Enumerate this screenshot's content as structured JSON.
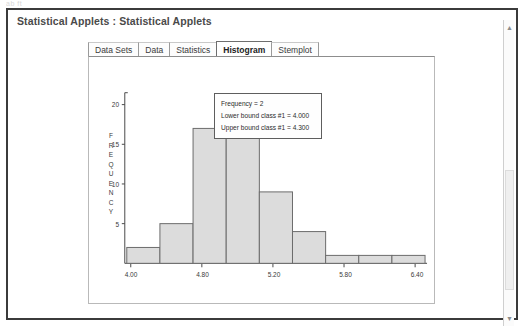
{
  "chrome_ghost": "ab ft",
  "window": {
    "title": "Statistical Applets : Statistical Applets"
  },
  "tabs": [
    {
      "label": "Data Sets",
      "selected": false
    },
    {
      "label": "Data",
      "selected": false
    },
    {
      "label": "Statistics",
      "selected": false
    },
    {
      "label": "Histogram",
      "selected": true
    },
    {
      "label": "Stemplot",
      "selected": false
    }
  ],
  "tooltip": {
    "frequency": "Frequency = 2",
    "lower_bound": "Lower bound class #1 = 4.000",
    "upper_bound": "Upper bound class #1 = 4.300"
  },
  "scrollbar": {
    "up_arrow": "▲",
    "down_arrow": "▼"
  },
  "chart_data": {
    "type": "bar",
    "title": "",
    "xlabel": "",
    "ylabel": "FREQUENCY",
    "ylabel_letters": [
      "F",
      "R",
      "E",
      "Q",
      "U",
      "E",
      "N",
      "C",
      "Y"
    ],
    "categories": [
      "4.00",
      "4.30",
      "4.60",
      "4.90",
      "5.20",
      "5.50",
      "5.80",
      "6.10",
      "6.40"
    ],
    "values": [
      2,
      5,
      17,
      17,
      9,
      4,
      1,
      1,
      1
    ],
    "bin_width": 0.3,
    "x_start": 4.0,
    "xlim": [
      4.0,
      6.7
    ],
    "ylim": [
      0,
      21
    ],
    "yticks": [
      5,
      10,
      15,
      20
    ],
    "ytick_labels": [
      "5",
      "10",
      "15",
      "20"
    ],
    "xticks": [
      4.0,
      4.8,
      5.2,
      5.8,
      6.4
    ],
    "xtick_labels": [
      "4.00",
      "4.80",
      "5.20",
      "5.80",
      "6.40"
    ],
    "grid": false,
    "legend": "none",
    "bar_fill": "#dcdcdc",
    "bar_stroke": "#6b6b6b",
    "axis_color": "#4a4a4a"
  }
}
